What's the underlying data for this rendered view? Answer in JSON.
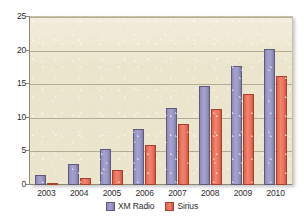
{
  "chart_data": {
    "type": "bar",
    "title": "",
    "subtitle": "",
    "xlabel": "",
    "ylabel": "",
    "categories": [
      "2003",
      "2004",
      "2005",
      "2006",
      "2007",
      "2008",
      "2009",
      "2010"
    ],
    "series": [
      {
        "name": "XM Radio",
        "color": "#9b98c6",
        "values": [
          1.5,
          3.2,
          5.4,
          8.3,
          11.5,
          14.7,
          17.7,
          20.2
        ]
      },
      {
        "name": "Sirius",
        "color": "#e87461",
        "values": [
          0.3,
          1.1,
          2.3,
          6.0,
          9.1,
          11.3,
          13.6,
          16.2
        ]
      }
    ],
    "ylim": [
      0,
      25
    ],
    "ytick_labels": [
      "0",
      "5",
      "10",
      "15",
      "20",
      "25"
    ],
    "ytick_values": [
      0,
      5,
      10,
      15,
      20,
      25
    ],
    "grid": true,
    "legend_position": "bottom",
    "plot_background_color": "#ece5cd",
    "gridline_color": "#a9a28c",
    "axis_color": "#8e8873"
  },
  "legend": {
    "items": [
      {
        "label": "XM Radio"
      },
      {
        "label": "Sirius"
      }
    ]
  }
}
